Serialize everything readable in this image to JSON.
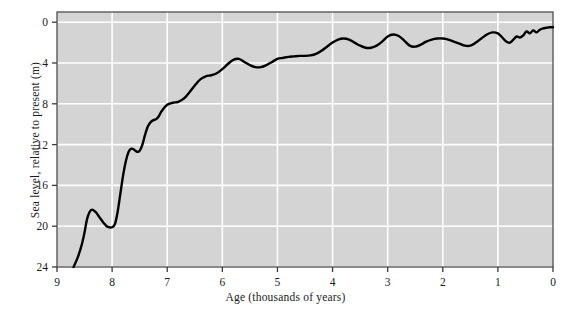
{
  "chart_data": {
    "type": "line",
    "title": "",
    "subtitle": "",
    "xlabel": "Age (thousands of years)",
    "ylabel": "Sea level, relative to present (m)",
    "xlim": [
      9,
      0
    ],
    "ylim": [
      24,
      -1
    ],
    "x_ticks": [
      9,
      8,
      7,
      6,
      5,
      4,
      3,
      2,
      1,
      0
    ],
    "x_tick_labels": [
      "9",
      "8",
      "7",
      "6",
      "5",
      "4",
      "3",
      "2",
      "1",
      "0"
    ],
    "y_ticks": [
      0,
      4,
      8,
      12,
      16,
      20,
      24
    ],
    "y_tick_labels": [
      "0",
      "4",
      "8",
      "12",
      "16",
      "20",
      "24"
    ],
    "y_axis_inverted": true,
    "x_axis_inverted": true,
    "grid": true,
    "grid_color": "#ffffff",
    "plot_background": "#d4d4d4",
    "line_color": "#000000",
    "line_width": 2.4,
    "legend": null,
    "annotations": [],
    "series": [
      {
        "name": "Sea level",
        "x": [
          8.7,
          8.62,
          8.55,
          8.5,
          8.45,
          8.38,
          8.3,
          8.22,
          8.15,
          8.1,
          8.05,
          8.0,
          7.95,
          7.9,
          7.85,
          7.8,
          7.75,
          7.7,
          7.65,
          7.6,
          7.55,
          7.5,
          7.45,
          7.4,
          7.35,
          7.3,
          7.25,
          7.2,
          7.15,
          7.1,
          7.0,
          6.9,
          6.8,
          6.7,
          6.6,
          6.5,
          6.4,
          6.3,
          6.2,
          6.1,
          6.0,
          5.9,
          5.8,
          5.7,
          5.6,
          5.5,
          5.4,
          5.3,
          5.2,
          5.1,
          5.0,
          4.9,
          4.8,
          4.7,
          4.6,
          4.5,
          4.4,
          4.3,
          4.2,
          4.1,
          4.0,
          3.9,
          3.8,
          3.7,
          3.6,
          3.5,
          3.4,
          3.3,
          3.2,
          3.1,
          3.0,
          2.9,
          2.8,
          2.7,
          2.6,
          2.5,
          2.4,
          2.3,
          2.2,
          2.1,
          2.0,
          1.9,
          1.8,
          1.7,
          1.6,
          1.5,
          1.4,
          1.3,
          1.2,
          1.1,
          1.0,
          0.92,
          0.85,
          0.78,
          0.72,
          0.66,
          0.6,
          0.54,
          0.48,
          0.42,
          0.36,
          0.3,
          0.24,
          0.18,
          0.12,
          0.06,
          0.0
        ],
        "y": [
          24.0,
          23.0,
          21.8,
          20.6,
          19.2,
          18.4,
          18.6,
          19.2,
          19.7,
          20.0,
          20.1,
          20.1,
          19.8,
          18.6,
          16.8,
          15.0,
          13.6,
          12.7,
          12.4,
          12.5,
          12.7,
          12.6,
          12.0,
          11.0,
          10.2,
          9.8,
          9.6,
          9.5,
          9.2,
          8.7,
          8.1,
          7.9,
          7.8,
          7.5,
          6.9,
          6.2,
          5.6,
          5.3,
          5.2,
          5.0,
          4.6,
          4.1,
          3.7,
          3.6,
          3.9,
          4.2,
          4.4,
          4.4,
          4.2,
          3.9,
          3.6,
          3.5,
          3.4,
          3.35,
          3.3,
          3.3,
          3.25,
          3.1,
          2.8,
          2.4,
          2.0,
          1.7,
          1.6,
          1.7,
          2.0,
          2.3,
          2.5,
          2.5,
          2.3,
          1.9,
          1.4,
          1.2,
          1.35,
          1.8,
          2.3,
          2.4,
          2.2,
          1.9,
          1.7,
          1.6,
          1.6,
          1.7,
          1.9,
          2.1,
          2.3,
          2.3,
          2.0,
          1.6,
          1.2,
          1.0,
          1.1,
          1.5,
          1.9,
          2.0,
          1.7,
          1.4,
          1.5,
          1.3,
          0.9,
          1.1,
          0.8,
          1.0,
          0.75,
          0.6,
          0.55,
          0.5,
          0.5
        ]
      }
    ]
  },
  "figure": {
    "plot_left": 57,
    "plot_right": 553,
    "plot_top": 12,
    "plot_bottom": 267
  }
}
